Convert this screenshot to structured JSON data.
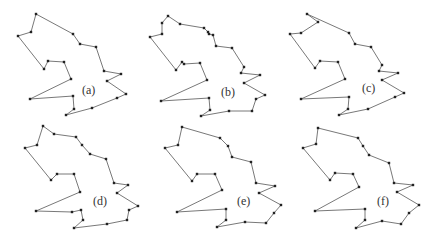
{
  "figure": {
    "panels": [
      {
        "id": "a",
        "label": "(a)",
        "label_pos": [
          82,
          94
        ],
        "points": [
          [
            36,
            14
          ],
          [
            31,
            32
          ],
          [
            18,
            36
          ],
          [
            44,
            69
          ],
          [
            48,
            61
          ],
          [
            64,
            62
          ],
          [
            71,
            79
          ],
          [
            30,
            99
          ],
          [
            73,
            96
          ],
          [
            74,
            109
          ],
          [
            66,
            115
          ],
          [
            92,
            108
          ],
          [
            117,
            98
          ],
          [
            126,
            94
          ],
          [
            107,
            81
          ],
          [
            121,
            74
          ],
          [
            104,
            71
          ],
          [
            96,
            47
          ],
          [
            80,
            44
          ],
          [
            73,
            34
          ]
        ],
        "vertices_marked": "all"
      },
      {
        "id": "b",
        "label": "(b)",
        "label_pos": [
          221,
          96
        ],
        "points": [
          [
            168,
            16
          ],
          [
            162,
            23
          ],
          [
            162,
            34
          ],
          [
            150,
            37
          ],
          [
            176,
            70
          ],
          [
            182,
            62
          ],
          [
            184,
            64
          ],
          [
            200,
            63
          ],
          [
            207,
            80
          ],
          [
            161,
            101
          ],
          [
            209,
            98
          ],
          [
            210,
            110
          ],
          [
            201,
            116
          ],
          [
            229,
            111
          ],
          [
            252,
            111
          ],
          [
            256,
            99
          ],
          [
            265,
            95
          ],
          [
            244,
            83
          ],
          [
            260,
            75
          ],
          [
            241,
            73
          ],
          [
            244,
            67
          ],
          [
            232,
            48
          ],
          [
            216,
            46
          ],
          [
            213,
            35
          ],
          [
            209,
            34
          ],
          [
            208,
            32
          ],
          [
            204,
            28
          ],
          [
            180,
            24
          ]
        ],
        "vertices_marked": "all"
      },
      {
        "id": "c",
        "label": "(c)",
        "label_pos": [
          362,
          92
        ],
        "points": [
          [
            307,
            14
          ],
          [
            318,
            22
          ],
          [
            301,
            33
          ],
          [
            290,
            34
          ],
          [
            315,
            68
          ],
          [
            320,
            61
          ],
          [
            338,
            62
          ],
          [
            345,
            79
          ],
          [
            301,
            99
          ],
          [
            349,
            97
          ],
          [
            348,
            109
          ],
          [
            339,
            115
          ],
          [
            368,
            109
          ],
          [
            395,
            97
          ],
          [
            404,
            93
          ],
          [
            382,
            80
          ],
          [
            398,
            73
          ],
          [
            379,
            71
          ],
          [
            382,
            65
          ],
          [
            371,
            47
          ],
          [
            355,
            44
          ],
          [
            349,
            33
          ]
        ],
        "vertices_marked": "all"
      },
      {
        "id": "d",
        "label": "(d)",
        "label_pos": [
          93,
          205
        ],
        "points": [
          [
            43,
            126
          ],
          [
            37,
            145
          ],
          [
            25,
            148
          ],
          [
            51,
            180
          ],
          [
            57,
            174
          ],
          [
            74,
            174
          ],
          [
            80,
            192
          ],
          [
            36,
            211
          ],
          [
            72,
            212
          ],
          [
            81,
            210
          ],
          [
            83,
            220
          ],
          [
            74,
            228
          ],
          [
            107,
            224
          ],
          [
            127,
            220
          ],
          [
            129,
            210
          ],
          [
            138,
            206
          ],
          [
            117,
            193
          ],
          [
            128,
            185
          ],
          [
            114,
            183
          ],
          [
            106,
            159
          ],
          [
            90,
            154
          ],
          [
            82,
            145
          ],
          [
            76,
            137
          ],
          [
            54,
            134
          ]
        ],
        "vertices_marked": "all"
      },
      {
        "id": "e",
        "label": "(e)",
        "label_pos": [
          237,
          205
        ],
        "points": [
          [
            182,
            127
          ],
          [
            178,
            145
          ],
          [
            165,
            148
          ],
          [
            192,
            181
          ],
          [
            197,
            174
          ],
          [
            215,
            174
          ],
          [
            222,
            190
          ],
          [
            177,
            212
          ],
          [
            226,
            209
          ],
          [
            226,
            220
          ],
          [
            217,
            227
          ],
          [
            245,
            222
          ],
          [
            266,
            223
          ],
          [
            274,
            213
          ],
          [
            281,
            205
          ],
          [
            259,
            193
          ],
          [
            275,
            186
          ],
          [
            256,
            183
          ],
          [
            251,
            162
          ],
          [
            232,
            157
          ],
          [
            228,
            146
          ],
          [
            220,
            138
          ]
        ],
        "vertices_marked": "all"
      },
      {
        "id": "f",
        "label": "(f)",
        "label_pos": [
          377,
          205
        ],
        "points": [
          [
            318,
            128
          ],
          [
            316,
            144
          ],
          [
            303,
            148
          ],
          [
            330,
            180
          ],
          [
            335,
            173
          ],
          [
            353,
            174
          ],
          [
            359,
            187
          ],
          [
            315,
            211
          ],
          [
            365,
            209
          ],
          [
            365,
            220
          ],
          [
            356,
            228
          ],
          [
            382,
            221
          ],
          [
            401,
            224
          ],
          [
            409,
            213
          ],
          [
            419,
            205
          ],
          [
            397,
            192
          ],
          [
            413,
            185
          ],
          [
            394,
            183
          ],
          [
            389,
            163
          ],
          [
            369,
            155
          ],
          [
            363,
            146
          ],
          [
            358,
            138
          ]
        ],
        "vertices_marked": "all"
      }
    ],
    "colors": {
      "outline": "#555555",
      "vertex": "#222222",
      "label": "#333333",
      "background": "#ffffff"
    }
  }
}
